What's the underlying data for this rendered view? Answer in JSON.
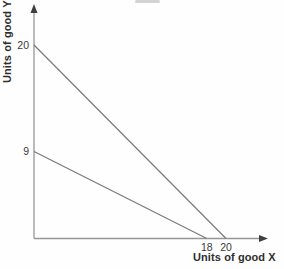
{
  "figure": {
    "background": "#fefefe"
  },
  "chart_data": {
    "type": "line",
    "title": "",
    "xlabel": "Units of good X",
    "ylabel": "Units of good Y",
    "xlim": [
      0,
      24
    ],
    "ylim": [
      0,
      24
    ],
    "grid": false,
    "legend": null,
    "x_ticks": [
      {
        "value": 18,
        "label": "18"
      },
      {
        "value": 20,
        "label": "20"
      }
    ],
    "y_ticks": [
      {
        "value": 20,
        "label": "20"
      },
      {
        "value": 9,
        "label": "9"
      }
    ],
    "series": [
      {
        "name": "budget-line-outer",
        "points": [
          [
            0,
            20
          ],
          [
            20,
            0
          ]
        ]
      },
      {
        "name": "budget-line-inner",
        "points": [
          [
            0,
            9
          ],
          [
            18,
            0
          ]
        ]
      }
    ]
  },
  "style": {
    "axis_color": "#969696",
    "line_color": "#7a7a7a",
    "arrow_color": "#3f3f3f",
    "text_color": "#3a3a3a"
  }
}
